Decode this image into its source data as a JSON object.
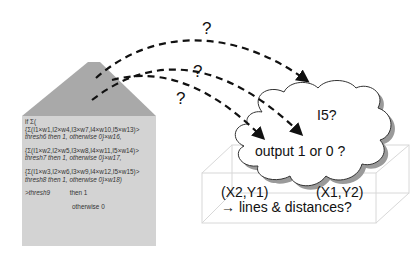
{
  "house": {
    "lines": [
      "if Σ(",
      "{Σ(I1×w1,I2×w4,I3×w7,I4×w10,I5×w13)>",
      "thresh6 then 1, otherwise 0}×w16,",
      "{Σ(I1×w2,I2×w5,I3×w8,I4×w11,I5×w14)>",
      "thresh7 then 1, otherwise 0}×w17,",
      "{Σ(I1×w3,I2×w6,I3×w9,I4×w12,I5×w15)>",
      "thresh8 then 1, otherwise 0}×w18)",
      ">thresh9",
      "then 1",
      "otherwise 0"
    ],
    "roof_color": "#a9a9a9",
    "body_color": "#d3d3d3"
  },
  "arrows": {
    "question_marks": [
      "?",
      "?",
      "?"
    ]
  },
  "cloud": {
    "label_top": "I5?",
    "label_main": "output 1 or 0 ?",
    "shadow_color": "#9a9a9a"
  },
  "box": {
    "label_left": "(X2,Y1)",
    "label_right": "(X1,Y2)",
    "label_bottom": "→ lines & distances?"
  }
}
